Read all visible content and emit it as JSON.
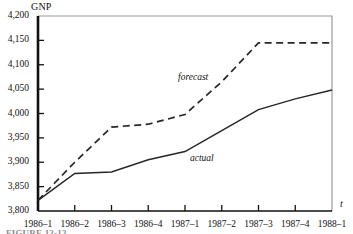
{
  "figure": {
    "caption": "FIGURE 12-12"
  },
  "chart_data": {
    "type": "line",
    "title": "",
    "ylabel": "GNP",
    "xlabel": "t",
    "ylim": [
      3800,
      4200
    ],
    "yticks": [
      "3,800",
      "3,850",
      "3,900",
      "3,950",
      "4,000",
      "4,050",
      "4,100",
      "4,150",
      "4,200"
    ],
    "ytick_values": [
      3800,
      3850,
      3900,
      3950,
      4000,
      4050,
      4100,
      4150,
      4200
    ],
    "grid": false,
    "legend_position": "inline-annotation",
    "categories": [
      "1986–1",
      "1986–2",
      "1986–3",
      "1986–4",
      "1987–1",
      "1987–2",
      "1987–3",
      "1987–4",
      "1988–1"
    ],
    "series": [
      {
        "name": "forecast",
        "style": "dashed",
        "color": "#262626",
        "values": [
          3822,
          3900,
          3972,
          3978,
          3998,
          4065,
          4145,
          4145,
          4145
        ]
      },
      {
        "name": "actual",
        "style": "solid",
        "color": "#262626",
        "values": [
          3822,
          3877,
          3880,
          3905,
          3922,
          3965,
          4008,
          4030,
          4048
        ]
      }
    ],
    "annotations": [
      {
        "text": "forecast",
        "style": "italic"
      },
      {
        "text": "actual",
        "style": "italic"
      }
    ],
    "colors": {
      "axis": "#111111",
      "frame": "#9a9a9a",
      "series": "#262626",
      "text": "#111111"
    }
  }
}
